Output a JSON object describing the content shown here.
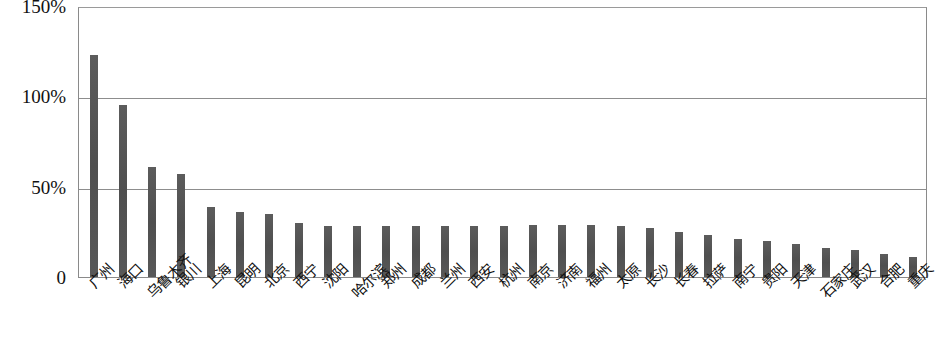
{
  "chart_data": {
    "type": "bar",
    "title": "",
    "subtitle": "",
    "xlabel": "",
    "ylabel": "",
    "ylim": [
      0,
      150
    ],
    "yunit": "%",
    "grid": true,
    "gridlines": [
      50,
      100
    ],
    "legend": "none",
    "bar_color": "#555555",
    "plot_border_color": "#8a8a8a",
    "ytick_labels": [
      "150%",
      "100%",
      "50%",
      "0"
    ],
    "ytick_values": [
      150,
      100,
      50,
      0
    ],
    "categories": [
      "广州",
      "海口",
      "乌鲁木齐",
      "银川",
      "上海",
      "昆明",
      "北京",
      "西宁",
      "沈阳",
      "哈尔滨",
      "郑州",
      "成都",
      "兰州",
      "西安",
      "杭州",
      "南京",
      "济南",
      "福州",
      "太原",
      "长沙",
      "长春",
      "拉萨",
      "南宁",
      "贵阳",
      "天津",
      "石家庄",
      "武汉",
      "合肥",
      "重庆"
    ],
    "values": [
      123,
      95,
      61,
      57,
      39,
      36,
      35,
      30,
      28,
      28,
      28,
      28,
      28,
      28,
      28,
      29,
      29,
      29,
      28,
      27,
      25,
      23,
      21,
      20,
      18,
      16,
      15,
      13,
      11
    ],
    "series": [
      {
        "name": "",
        "values": [
          123,
          95,
          61,
          57,
          39,
          36,
          35,
          30,
          28,
          28,
          28,
          28,
          28,
          28,
          28,
          29,
          29,
          29,
          28,
          27,
          25,
          23,
          21,
          20,
          18,
          16,
          15,
          13,
          11
        ]
      }
    ]
  }
}
